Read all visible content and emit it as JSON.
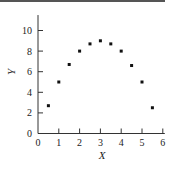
{
  "chart_data": {
    "type": "scatter",
    "title": "",
    "xlabel": "X",
    "ylabel": "Y",
    "xlim": [
      0,
      6
    ],
    "ylim": [
      0,
      11.5
    ],
    "xticks": [
      0,
      1,
      2,
      3,
      4,
      5,
      6
    ],
    "yticks": [
      0,
      2,
      4,
      6,
      8,
      10
    ],
    "grid": false,
    "legend": null,
    "series": [
      {
        "name": "data",
        "x": [
          0.5,
          1.0,
          1.5,
          2.0,
          2.5,
          3.0,
          3.5,
          4.0,
          4.5,
          5.0,
          5.5
        ],
        "y": [
          2.7,
          5.0,
          6.7,
          8.0,
          8.7,
          9.0,
          8.7,
          8.0,
          6.6,
          5.0,
          2.5
        ]
      }
    ]
  }
}
